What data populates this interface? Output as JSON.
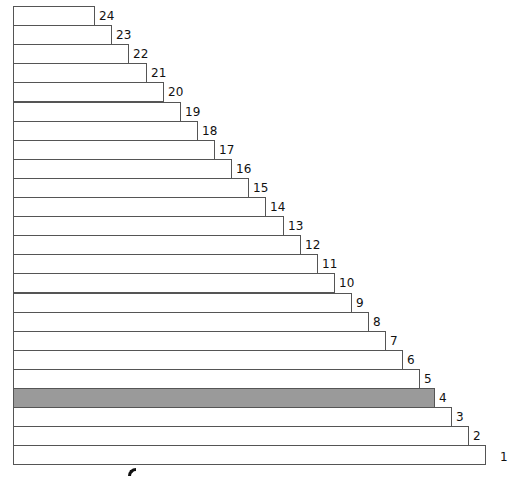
{
  "diagram": {
    "type": "staircase",
    "highlight_color": "#9a9a9a",
    "highlighted_index": 4,
    "bars": [
      {
        "label": "24",
        "width": 82
      },
      {
        "label": "23",
        "width": 99
      },
      {
        "label": "22",
        "width": 116
      },
      {
        "label": "21",
        "width": 134
      },
      {
        "label": "20",
        "width": 151
      },
      {
        "label": "19",
        "width": 168
      },
      {
        "label": "18",
        "width": 185
      },
      {
        "label": "17",
        "width": 202
      },
      {
        "label": "16",
        "width": 219
      },
      {
        "label": "15",
        "width": 236
      },
      {
        "label": "14",
        "width": 253
      },
      {
        "label": "13",
        "width": 271
      },
      {
        "label": "12",
        "width": 288
      },
      {
        "label": "11",
        "width": 305
      },
      {
        "label": "10",
        "width": 322
      },
      {
        "label": "9",
        "width": 339
      },
      {
        "label": "8",
        "width": 356
      },
      {
        "label": "7",
        "width": 373
      },
      {
        "label": "6",
        "width": 390
      },
      {
        "label": "5",
        "width": 407
      },
      {
        "label": "4",
        "width": 422
      },
      {
        "label": "3",
        "width": 439
      },
      {
        "label": "2",
        "width": 456
      },
      {
        "label": "1",
        "width": 473
      }
    ]
  }
}
